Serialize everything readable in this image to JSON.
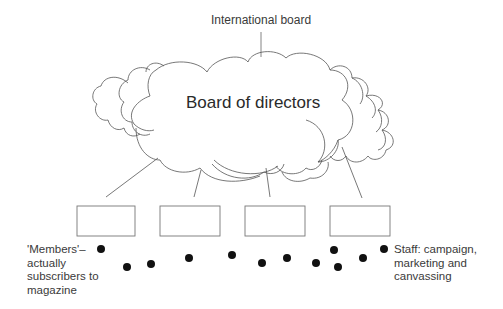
{
  "diagram": {
    "top_label": "International board",
    "cloud_label": "Board of directors",
    "units": [
      {
        "label": ""
      },
      {
        "label": ""
      },
      {
        "label": ""
      },
      {
        "label": ""
      }
    ],
    "left_annotation": {
      "lines": [
        "'Members'–",
        "actually",
        "subscribers to",
        "magazine"
      ]
    },
    "right_annotation": {
      "lines": [
        "Staff: campaign,",
        "marketing and",
        "canvassing"
      ]
    },
    "dots_count": 12,
    "colors": {
      "line": "#555555",
      "box_border": "#777777",
      "dot": "#111111",
      "text": "#333333"
    }
  }
}
